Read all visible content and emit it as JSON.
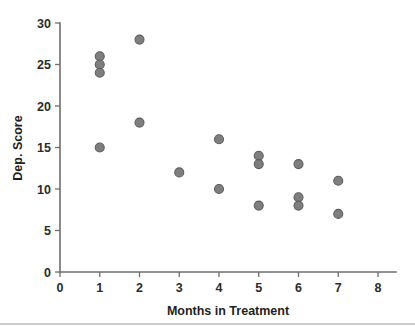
{
  "chart_data": {
    "type": "scatter",
    "title": "",
    "xlabel": "Months in Treatment",
    "ylabel": "Dep. Score",
    "xlim": [
      0,
      8
    ],
    "ylim": [
      0,
      30
    ],
    "xticks": [
      0,
      1,
      2,
      3,
      4,
      5,
      6,
      7,
      8
    ],
    "yticks": [
      0,
      5,
      10,
      15,
      20,
      25,
      30
    ],
    "xtick_labels": [
      "0",
      "1",
      "2",
      "3",
      "4",
      "5",
      "6",
      "7",
      "8"
    ],
    "ytick_labels": [
      "0",
      "5",
      "10",
      "15",
      "20",
      "25",
      "30"
    ],
    "grid": false,
    "legend": false,
    "marker": {
      "shape": "circle",
      "fill_color": "#7e7e7e",
      "edge_color": "#5d5d5d",
      "size_px": 9
    },
    "x": [
      1,
      1,
      1,
      1,
      2,
      2,
      3,
      4,
      4,
      5,
      5,
      5,
      6,
      6,
      6,
      7,
      7
    ],
    "y": [
      26,
      25,
      24,
      15,
      28,
      18,
      12,
      16,
      10,
      14,
      13,
      8,
      13,
      9,
      8,
      11,
      7
    ],
    "points": [
      {
        "x": 1,
        "y": 26
      },
      {
        "x": 1,
        "y": 25
      },
      {
        "x": 1,
        "y": 24
      },
      {
        "x": 1,
        "y": 15
      },
      {
        "x": 2,
        "y": 28
      },
      {
        "x": 2,
        "y": 18
      },
      {
        "x": 3,
        "y": 12
      },
      {
        "x": 4,
        "y": 16
      },
      {
        "x": 4,
        "y": 10
      },
      {
        "x": 5,
        "y": 14
      },
      {
        "x": 5,
        "y": 13
      },
      {
        "x": 5,
        "y": 8
      },
      {
        "x": 6,
        "y": 13
      },
      {
        "x": 6,
        "y": 9
      },
      {
        "x": 6,
        "y": 8
      },
      {
        "x": 7,
        "y": 11
      },
      {
        "x": 7,
        "y": 7
      }
    ]
  },
  "colors": {
    "marker_fill": "#7e7e7e",
    "marker_edge": "#5d5d5d",
    "axis": "#6e6e6e",
    "text": "#1f1f1f",
    "background": "#ffffff",
    "footer_rule": "#9a9a9a"
  }
}
